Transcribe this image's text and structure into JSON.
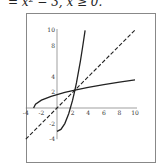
{
  "caption": "= x² − 3, x ≥ 0.",
  "chart_data": {
    "type": "line",
    "title": "",
    "xlabel": "",
    "ylabel": "",
    "xlim": [
      -4,
      10
    ],
    "ylim": [
      -4,
      10
    ],
    "grid": false,
    "x_ticks": [
      -4,
      -2,
      2,
      4,
      6,
      8,
      10
    ],
    "y_ticks": [
      -4,
      -2,
      2,
      4,
      8,
      10
    ],
    "series": [
      {
        "name": "f(x) = x^2 - 3, x >= 0",
        "style": "solid",
        "points": [
          [
            0,
            -3
          ],
          [
            0.5,
            -2.75
          ],
          [
            1,
            -2
          ],
          [
            1.5,
            -0.75
          ],
          [
            2,
            1
          ],
          [
            2.3,
            2.29
          ],
          [
            2.5,
            3.25
          ],
          [
            3,
            6
          ],
          [
            3.3,
            7.89
          ],
          [
            3.6,
            9.96
          ]
        ]
      },
      {
        "name": "f^-1(x) = sqrt(x + 3)",
        "style": "solid",
        "points": [
          [
            -3,
            0
          ],
          [
            -2.75,
            0.5
          ],
          [
            -2,
            1
          ],
          [
            -0.75,
            1.5
          ],
          [
            1,
            2
          ],
          [
            2.3,
            2.3
          ],
          [
            4,
            2.65
          ],
          [
            6,
            3
          ],
          [
            8,
            3.32
          ],
          [
            10,
            3.61
          ]
        ]
      },
      {
        "name": "y = x",
        "style": "dashed",
        "points": [
          [
            -4,
            -4
          ],
          [
            10,
            10
          ]
        ]
      }
    ],
    "intersection": [
      2.3,
      2.3
    ]
  }
}
